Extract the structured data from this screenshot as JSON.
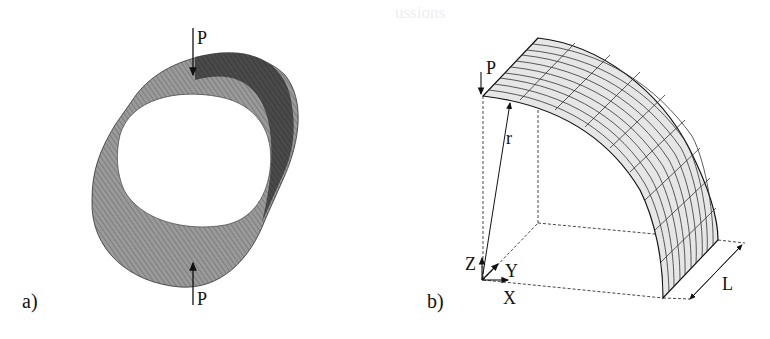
{
  "figure": {
    "panels": [
      {
        "id": "a",
        "label": "a)",
        "description": "Full cylindrical shell FE mesh compressed by diametrically opposed point loads",
        "load_top_label": "P",
        "load_bottom_label": "P"
      },
      {
        "id": "b",
        "label": "b)",
        "description": "Quarter of cylindrical shell FE mesh with coordinate axes",
        "load_label": "P",
        "radius_label": "r",
        "length_label": "L",
        "axes": {
          "z": "Z",
          "y": "Y",
          "x": "X"
        }
      }
    ],
    "colors": {
      "mesh_dark": "#3a3a3a",
      "mesh_mid": "#7a7a7a",
      "mesh_light": "#d8d8d8",
      "line": "#111111"
    }
  },
  "background_bleed_text": [
    "ussions",
    "",
    "",
    "",
    "",
    "",
    "",
    "",
    "",
    "",
    "",
    ""
  ]
}
